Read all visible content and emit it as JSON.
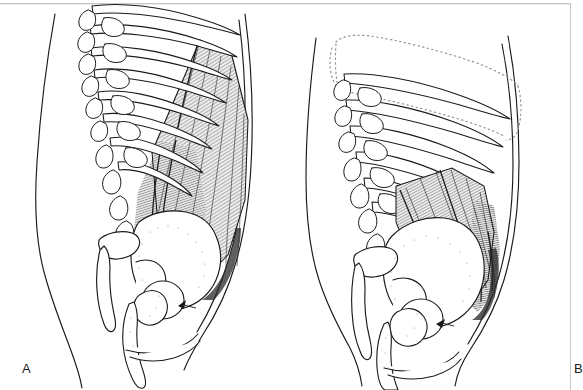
{
  "figure": {
    "kind": "anatomical-line-drawing",
    "background_color": "#ffffff",
    "ink_color": "#1a1a1a",
    "muscle_fill_color": "#e8e8e8",
    "frame_color": "#c9c9c9",
    "width": 576,
    "height": 390,
    "panel_count": 2
  },
  "panels": [
    {
      "id": "A",
      "label": "A",
      "label_x": 22,
      "label_y": 362,
      "description": "Trunk in neutral/elongated posture; ribcage drawn with solid outlines, posterior trunk muscle shown elongated and fully hatched",
      "ribcage_style": "solid",
      "muscle_state": "elongated",
      "muscle_shading": "dense-diagonal-hatching",
      "structures": [
        "anterior body contour",
        "posterior body contour",
        "ribs",
        "lumbar vertebrae",
        "transverse processes",
        "spinous processes",
        "quadratus lumborum muscle",
        "ilium",
        "sacrum",
        "femoral head",
        "greater trochanter",
        "pubic symphysis",
        "femur"
      ]
    },
    {
      "id": "B",
      "label": "B",
      "label_x": 286,
      "label_y": 362,
      "description": "Trunk in side-bent / shortened posture; upper ribcage shown as dotted ghost outline indicating former position, muscle appears shortened and bunched",
      "ribcage_style": "dotted-ghost-plus-solid",
      "muscle_state": "shortened",
      "muscle_shading": "dense-diagonal-hatching",
      "structures": [
        "anterior body contour",
        "posterior body contour",
        "dotted ribcage outline",
        "ribs",
        "lumbar vertebrae",
        "transverse processes",
        "spinous processes",
        "quadratus lumborum muscle",
        "ilium",
        "sacrum",
        "femoral head",
        "greater trochanter",
        "pubic symphysis",
        "femur"
      ]
    }
  ]
}
